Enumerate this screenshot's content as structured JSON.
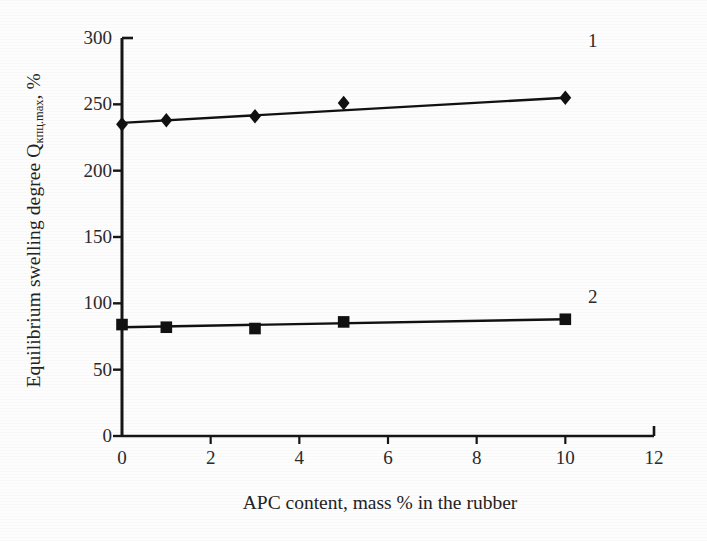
{
  "chart_data": {
    "type": "line",
    "title": "",
    "subtitle": "",
    "xlabel": "APC content, mass % in the rubber",
    "ylabel": "Equilibrium swelling degree Q",
    "ylabel_subscript": "кпц.max",
    "ylabel_suffix": ", %",
    "xlim": [
      0,
      12
    ],
    "ylim": [
      0,
      300
    ],
    "xticks": [
      0,
      2,
      4,
      6,
      8,
      10,
      12
    ],
    "yticks": [
      0,
      50,
      100,
      150,
      200,
      250,
      300
    ],
    "xtick_labels": [
      "0",
      "2",
      "4",
      "6",
      "8",
      "10",
      "12"
    ],
    "ytick_labels": [
      "0",
      "50",
      "100",
      "150",
      "200",
      "250",
      "300"
    ],
    "grid": false,
    "legend_position": "inline-right-end",
    "series": [
      {
        "name": "1",
        "marker": "diamond",
        "color": "#111111",
        "x": [
          0,
          1,
          3,
          5,
          10
        ],
        "values": [
          235,
          238,
          241,
          251,
          255
        ],
        "trend_start": 236,
        "trend_end": 255
      },
      {
        "name": "2",
        "marker": "square",
        "color": "#111111",
        "x": [
          0,
          1,
          3,
          5,
          10
        ],
        "values": [
          84,
          82,
          81,
          86,
          88
        ],
        "trend_start": 82,
        "trend_end": 88
      }
    ],
    "annotations": [
      {
        "text": "1",
        "x": 10.9,
        "y": 283
      },
      {
        "text": "2",
        "x": 10.9,
        "y": 105
      }
    ]
  },
  "axes": {
    "y_axis_name": "y-axis",
    "x_axis_name": "x-axis"
  }
}
